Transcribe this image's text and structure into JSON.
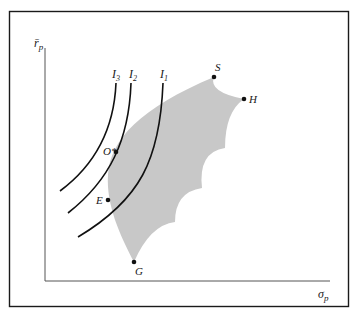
{
  "figure": {
    "type": "efficient-set-with-indifference-curves",
    "colors": {
      "frame": "#1a1a1a",
      "axis": "#555555",
      "feasible_set": "#c8c8c8",
      "curve": "#111111",
      "point": "#111111"
    },
    "axes": {
      "y_label_main": "r̄",
      "y_label_sub": "p",
      "x_label_main": "σ",
      "x_label_sub": "p"
    },
    "curves": [
      {
        "id": "I3",
        "label_main": "I",
        "label_sub": "3"
      },
      {
        "id": "I2",
        "label_main": "I",
        "label_sub": "2"
      },
      {
        "id": "I1",
        "label_main": "I",
        "label_sub": "1"
      }
    ],
    "points": [
      {
        "id": "S",
        "label": "S"
      },
      {
        "id": "H",
        "label": "H"
      },
      {
        "id": "O",
        "label": "O*"
      },
      {
        "id": "E",
        "label": "E"
      },
      {
        "id": "G",
        "label": "G"
      }
    ]
  }
}
